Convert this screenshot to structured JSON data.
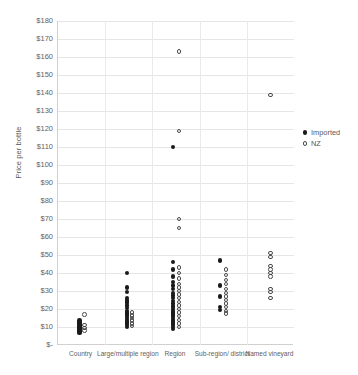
{
  "chart_data": {
    "type": "scatter",
    "title": "",
    "xlabel": "",
    "ylabel": "Price per bottle",
    "ylim": [
      0,
      180
    ],
    "ytick_step": 10,
    "grid": true,
    "legend_position": "right",
    "categories": [
      "Country",
      "Large/multiple region",
      "Region",
      "Sub-region/ district",
      "Named vineyard"
    ],
    "ytick_labels": [
      "$180",
      "$170",
      "$160",
      "$150",
      "$140",
      "$130",
      "$120",
      "$110",
      "$100",
      "$90",
      "$80",
      "$70",
      "$60",
      "$50",
      "$40",
      "$30",
      "$20",
      "$10",
      "$-"
    ],
    "ytick_values": [
      180,
      170,
      160,
      150,
      140,
      130,
      120,
      110,
      100,
      90,
      80,
      70,
      60,
      50,
      40,
      30,
      20,
      10,
      0
    ],
    "series": [
      {
        "name": "Imported",
        "marker": "filled-circle",
        "color": "#1a1a1a",
        "points": [
          {
            "category": "Country",
            "jitter": -2,
            "value": 13.5
          },
          {
            "category": "Country",
            "jitter": -2,
            "value": 12.5
          },
          {
            "category": "Country",
            "jitter": -2,
            "value": 11.8
          },
          {
            "category": "Country",
            "jitter": -2,
            "value": 11.0
          },
          {
            "category": "Country",
            "jitter": -2,
            "value": 10.3
          },
          {
            "category": "Country",
            "jitter": -2,
            "value": 9.6
          },
          {
            "category": "Country",
            "jitter": -2,
            "value": 9.0
          },
          {
            "category": "Country",
            "jitter": -2,
            "value": 8.4
          },
          {
            "category": "Country",
            "jitter": -2,
            "value": 7.8
          },
          {
            "category": "Country",
            "jitter": -2,
            "value": 7.2
          },
          {
            "category": "Country",
            "jitter": -2,
            "value": 6.6
          },
          {
            "category": "Large/multiple region",
            "jitter": -2,
            "value": 40.0
          },
          {
            "category": "Large/multiple region",
            "jitter": -2,
            "value": 32.0
          },
          {
            "category": "Large/multiple region",
            "jitter": -2,
            "value": 29.5
          },
          {
            "category": "Large/multiple region",
            "jitter": -2,
            "value": 26.0
          },
          {
            "category": "Large/multiple region",
            "jitter": -2,
            "value": 24.8
          },
          {
            "category": "Large/multiple region",
            "jitter": -2,
            "value": 23.5
          },
          {
            "category": "Large/multiple region",
            "jitter": -2,
            "value": 22.0
          },
          {
            "category": "Large/multiple region",
            "jitter": -2,
            "value": 20.5
          },
          {
            "category": "Large/multiple region",
            "jitter": -2,
            "value": 19.0
          },
          {
            "category": "Large/multiple region",
            "jitter": -2,
            "value": 18.0
          },
          {
            "category": "Large/multiple region",
            "jitter": -2,
            "value": 17.0
          },
          {
            "category": "Large/multiple region",
            "jitter": -2,
            "value": 16.0
          },
          {
            "category": "Large/multiple region",
            "jitter": -2,
            "value": 15.0
          },
          {
            "category": "Large/multiple region",
            "jitter": -2,
            "value": 14.0
          },
          {
            "category": "Large/multiple region",
            "jitter": -2,
            "value": 13.0
          },
          {
            "category": "Large/multiple region",
            "jitter": -2,
            "value": 12.0
          },
          {
            "category": "Large/multiple region",
            "jitter": -2,
            "value": 11.0
          },
          {
            "category": "Large/multiple region",
            "jitter": -2,
            "value": 10.0
          },
          {
            "category": "Region",
            "jitter": -3,
            "value": 110.0
          },
          {
            "category": "Region",
            "jitter": -3,
            "value": 46.0
          },
          {
            "category": "Region",
            "jitter": -3,
            "value": 42.0
          },
          {
            "category": "Region",
            "jitter": -3,
            "value": 38.0
          },
          {
            "category": "Region",
            "jitter": -3,
            "value": 35.0
          },
          {
            "category": "Region",
            "jitter": -3,
            "value": 33.0
          },
          {
            "category": "Region",
            "jitter": -3,
            "value": 31.0
          },
          {
            "category": "Region",
            "jitter": -3,
            "value": 29.0
          },
          {
            "category": "Region",
            "jitter": -3,
            "value": 27.5
          },
          {
            "category": "Region",
            "jitter": -3,
            "value": 26.0
          },
          {
            "category": "Region",
            "jitter": -3,
            "value": 24.5
          },
          {
            "category": "Region",
            "jitter": -3,
            "value": 23.0
          },
          {
            "category": "Region",
            "jitter": -3,
            "value": 21.5
          },
          {
            "category": "Region",
            "jitter": -3,
            "value": 20.0
          },
          {
            "category": "Region",
            "jitter": -3,
            "value": 19.0
          },
          {
            "category": "Region",
            "jitter": -3,
            "value": 18.0
          },
          {
            "category": "Region",
            "jitter": -3,
            "value": 17.0
          },
          {
            "category": "Region",
            "jitter": -3,
            "value": 16.0
          },
          {
            "category": "Region",
            "jitter": -3,
            "value": 15.0
          },
          {
            "category": "Region",
            "jitter": -3,
            "value": 14.0
          },
          {
            "category": "Region",
            "jitter": -3,
            "value": 13.0
          },
          {
            "category": "Region",
            "jitter": -3,
            "value": 12.0
          },
          {
            "category": "Region",
            "jitter": -3,
            "value": 11.0
          },
          {
            "category": "Region",
            "jitter": -3,
            "value": 10.0
          },
          {
            "category": "Region",
            "jitter": -3,
            "value": 9.0
          },
          {
            "category": "Sub-region/ district",
            "jitter": -3,
            "value": 47.0
          },
          {
            "category": "Sub-region/ district",
            "jitter": -3,
            "value": 33.0
          },
          {
            "category": "Sub-region/ district",
            "jitter": -3,
            "value": 27.0
          },
          {
            "category": "Sub-region/ district",
            "jitter": -3,
            "value": 21.0
          },
          {
            "category": "Sub-region/ district",
            "jitter": -3,
            "value": 19.5
          }
        ]
      },
      {
        "name": "NZ",
        "marker": "open-circle",
        "color": "#4a4a4a",
        "points": [
          {
            "category": "Country",
            "jitter": 3,
            "value": 17.0
          },
          {
            "category": "Country",
            "jitter": 3,
            "value": 11.0
          },
          {
            "category": "Country",
            "jitter": 3,
            "value": 9.5
          },
          {
            "category": "Country",
            "jitter": 3,
            "value": 8.0
          },
          {
            "category": "Large/multiple region",
            "jitter": 3,
            "value": 18.0
          },
          {
            "category": "Large/multiple region",
            "jitter": 3,
            "value": 16.5
          },
          {
            "category": "Large/multiple region",
            "jitter": 3,
            "value": 15.0
          },
          {
            "category": "Large/multiple region",
            "jitter": 3,
            "value": 13.5
          },
          {
            "category": "Large/multiple region",
            "jitter": 3,
            "value": 12.0
          },
          {
            "category": "Large/multiple region",
            "jitter": 3,
            "value": 10.5
          },
          {
            "category": "Region",
            "jitter": 3,
            "value": 163.0
          },
          {
            "category": "Region",
            "jitter": 3,
            "value": 119.0
          },
          {
            "category": "Region",
            "jitter": 3,
            "value": 70.0
          },
          {
            "category": "Region",
            "jitter": 3,
            "value": 65.0
          },
          {
            "category": "Region",
            "jitter": 3,
            "value": 43.0
          },
          {
            "category": "Region",
            "jitter": 3,
            "value": 40.0
          },
          {
            "category": "Region",
            "jitter": 3,
            "value": 37.0
          },
          {
            "category": "Region",
            "jitter": 3,
            "value": 34.0
          },
          {
            "category": "Region",
            "jitter": 3,
            "value": 32.0
          },
          {
            "category": "Region",
            "jitter": 3,
            "value": 30.0
          },
          {
            "category": "Region",
            "jitter": 3,
            "value": 28.0
          },
          {
            "category": "Region",
            "jitter": 3,
            "value": 26.0
          },
          {
            "category": "Region",
            "jitter": 3,
            "value": 24.0
          },
          {
            "category": "Region",
            "jitter": 3,
            "value": 22.0
          },
          {
            "category": "Region",
            "jitter": 3,
            "value": 20.0
          },
          {
            "category": "Region",
            "jitter": 3,
            "value": 18.0
          },
          {
            "category": "Region",
            "jitter": 3,
            "value": 16.0
          },
          {
            "category": "Region",
            "jitter": 3,
            "value": 14.0
          },
          {
            "category": "Region",
            "jitter": 3,
            "value": 12.0
          },
          {
            "category": "Region",
            "jitter": 3,
            "value": 10.0
          },
          {
            "category": "Sub-region/ district",
            "jitter": 3,
            "value": 42.0
          },
          {
            "category": "Sub-region/ district",
            "jitter": 3,
            "value": 39.0
          },
          {
            "category": "Sub-region/ district",
            "jitter": 3,
            "value": 36.0
          },
          {
            "category": "Sub-region/ district",
            "jitter": 3,
            "value": 34.0
          },
          {
            "category": "Sub-region/ district",
            "jitter": 3,
            "value": 31.0
          },
          {
            "category": "Sub-region/ district",
            "jitter": 3,
            "value": 29.0
          },
          {
            "category": "Sub-region/ district",
            "jitter": 3,
            "value": 27.0
          },
          {
            "category": "Sub-region/ district",
            "jitter": 3,
            "value": 25.0
          },
          {
            "category": "Sub-region/ district",
            "jitter": 3,
            "value": 23.0
          },
          {
            "category": "Sub-region/ district",
            "jitter": 3,
            "value": 21.0
          },
          {
            "category": "Sub-region/ district",
            "jitter": 3,
            "value": 19.0
          },
          {
            "category": "Sub-region/ district",
            "jitter": 3,
            "value": 17.5
          },
          {
            "category": "Named vineyard",
            "jitter": 0,
            "value": 139.0
          },
          {
            "category": "Named vineyard",
            "jitter": 0,
            "value": 51.0
          },
          {
            "category": "Named vineyard",
            "jitter": 0,
            "value": 49.0
          },
          {
            "category": "Named vineyard",
            "jitter": 0,
            "value": 44.0
          },
          {
            "category": "Named vineyard",
            "jitter": 0,
            "value": 42.0
          },
          {
            "category": "Named vineyard",
            "jitter": 0,
            "value": 40.0
          },
          {
            "category": "Named vineyard",
            "jitter": 0,
            "value": 38.0
          },
          {
            "category": "Named vineyard",
            "jitter": 0,
            "value": 31.0
          },
          {
            "category": "Named vineyard",
            "jitter": 0,
            "value": 29.5
          },
          {
            "category": "Named vineyard",
            "jitter": 0,
            "value": 26.0
          }
        ]
      }
    ]
  },
  "legend": {
    "items": [
      {
        "label": "Imported",
        "marker": "filled-circle"
      },
      {
        "label": "NZ",
        "marker": "open-circle"
      }
    ]
  }
}
